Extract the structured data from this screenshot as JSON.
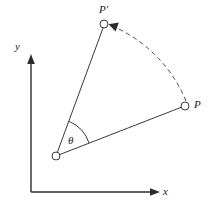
{
  "figure": {
    "background_color": "#ffffff",
    "stroke_color": "#1a1a1a",
    "caption": "Rotation of point P about the origin by angle theta to new position P prime"
  },
  "axes": {
    "x_label": "x",
    "y_label": "y",
    "origin_px": [
      31,
      192
    ],
    "x_axis_end_px": [
      160,
      192
    ],
    "y_axis_end_px": [
      31,
      57
    ]
  },
  "points": [
    {
      "id": "vertex",
      "label": "",
      "x": 56,
      "y": 156
    },
    {
      "id": "P",
      "label": "P",
      "x": 185,
      "y": 106
    },
    {
      "id": "Pprime",
      "label": "P′",
      "x": 104,
      "y": 24
    }
  ],
  "angle": {
    "symbol": "θ",
    "label_x": 68,
    "label_y": 136,
    "arc_radius": 36
  },
  "arc": {
    "style": "dashed",
    "from": "P",
    "to": "P′",
    "arrowhead_at": "P′"
  }
}
